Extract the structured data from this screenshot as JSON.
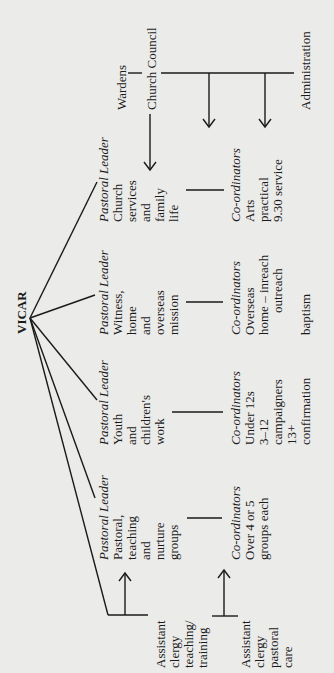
{
  "diagram": {
    "orientation": "rotated-90-ccw",
    "background": "#ebebe9",
    "ink": "#1a1a1a",
    "root": {
      "label": "VICAR"
    },
    "pastoral_leaders": [
      {
        "title": "Pastoral Leader",
        "lines": [
          "Pastoral,",
          "teaching",
          "and",
          "nurture",
          "groups"
        ]
      },
      {
        "title": "Pastoral Leader",
        "lines": [
          "Youth",
          "and",
          "children's",
          "work"
        ]
      },
      {
        "title": "Pastoral Leader",
        "lines": [
          "Witness,",
          "home",
          "and",
          "overseas",
          "mission"
        ]
      },
      {
        "title": "Pastoral Leader",
        "lines": [
          "Church",
          "services",
          "and",
          "family",
          "life"
        ]
      }
    ],
    "coordinators": [
      {
        "title": "Co-ordinators",
        "lines": [
          "Over 4 or 5",
          "groups each"
        ]
      },
      {
        "title": "Co-ordinators",
        "lines": [
          "Under 12s",
          "3–12",
          "campaigners",
          "13+",
          "confirmation"
        ]
      },
      {
        "title": "Co-ordinators",
        "lines": [
          "Overseas",
          "home – inreach",
          "outreach",
          "",
          "baptism"
        ]
      },
      {
        "title": "Co-ordinators",
        "lines": [
          "Arts",
          "practical",
          "9.30 service"
        ]
      }
    ],
    "assistant_clergy": [
      {
        "lines": [
          "Assistant",
          "clergy",
          "teaching/",
          "training"
        ]
      },
      {
        "lines": [
          "Assistant",
          "clergy",
          "pastoral",
          "care"
        ]
      }
    ],
    "governance": {
      "wardens": "Wardens",
      "church_council": "Church Council",
      "administration": "Administration"
    }
  }
}
